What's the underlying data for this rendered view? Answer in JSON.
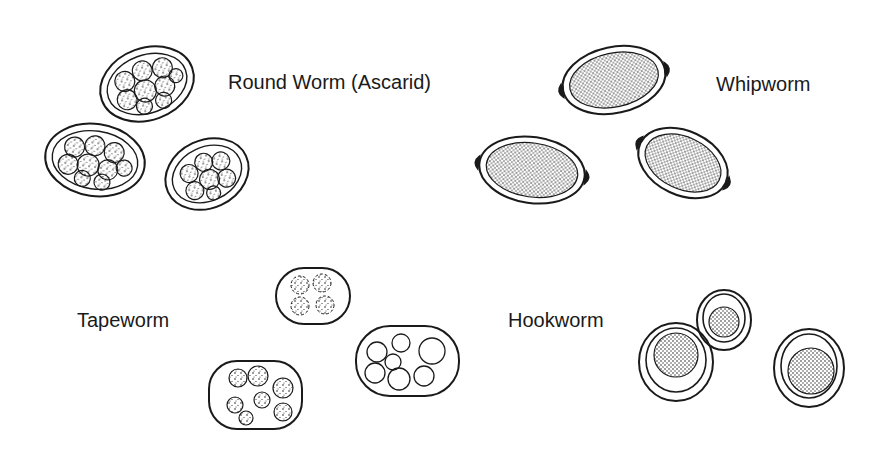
{
  "labels": {
    "roundworm": "Round Worm (Ascarid)",
    "whipworm": "Whipworm",
    "tapeworm": "Tapeworm",
    "hookworm": "Hookworm"
  },
  "colors": {
    "ink": "#1a1a1a",
    "background": "#ffffff"
  }
}
